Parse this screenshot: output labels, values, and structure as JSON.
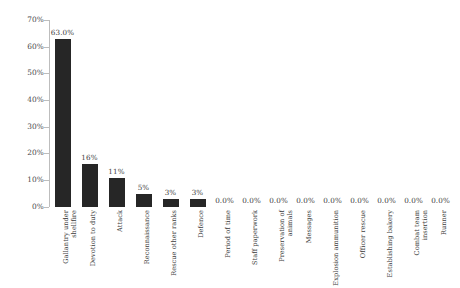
{
  "chart_data": {
    "type": "bar",
    "title": "",
    "xlabel": "",
    "ylabel": "",
    "ylim": [
      0,
      70
    ],
    "ytick_labels": [
      "70%",
      "60%",
      "50%",
      "40%",
      "30%",
      "20%",
      "10%",
      "0%"
    ],
    "ytick_values": [
      70,
      60,
      50,
      40,
      30,
      20,
      10,
      0
    ],
    "grid": false,
    "legend": "none",
    "bar_color": "#262626",
    "categories": [
      "Gallantry under shellfire",
      "Devotion to duty",
      "Attack",
      "Reconnaissance",
      "Rescue other ranks",
      "Defence",
      "Period of time",
      "Staff paperwork",
      "Preservation of animals",
      "Messages",
      "Explosion ammunition",
      "Officer rescue",
      "Establishing bakery",
      "Combat team insertion",
      "Runner"
    ],
    "values": [
      63.0,
      16.0,
      11.0,
      5.0,
      3.0,
      3.0,
      0.0,
      0.0,
      0.0,
      0.0,
      0.0,
      0.0,
      0.0,
      0.0,
      0.0
    ],
    "data_labels": [
      "63.0%",
      "16%",
      "11%",
      "5%",
      "3%",
      "3%",
      "0.0%",
      "0.0%",
      "0.0%",
      "0.0%",
      "0.0%",
      "0.0%",
      "0.0%",
      "0.0%",
      "0.0%"
    ]
  }
}
